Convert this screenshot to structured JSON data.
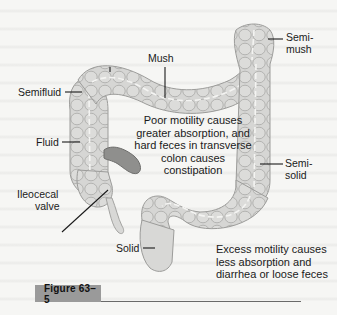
{
  "figure": {
    "label": "Figure 63–5",
    "subject": "colon",
    "colors": {
      "colon_fill": "#d4d4d2",
      "colon_stroke": "#9c9c9a",
      "ileum_fill": "#8f8f8d",
      "figure_tag_bg": "#9a9a9a"
    }
  },
  "labels": {
    "mush": "Mush",
    "semi_mush_1": "Semi-",
    "semi_mush_2": "mush",
    "semifluid": "Semifluid",
    "fluid": "Fluid",
    "ileocecal_1": "Ileocecal",
    "ileocecal_2": "valve",
    "semi_solid_1": "Semi-",
    "semi_solid_2": "solid",
    "solid": "Solid"
  },
  "notes": {
    "poor_motility": [
      "Poor motility causes",
      "greater absorption, and",
      "hard feces in transverse",
      "colon causes",
      "constipation"
    ],
    "excess_motility": [
      "Excess motility causes",
      "less absorption and",
      "diarrhea or loose feces"
    ]
  }
}
